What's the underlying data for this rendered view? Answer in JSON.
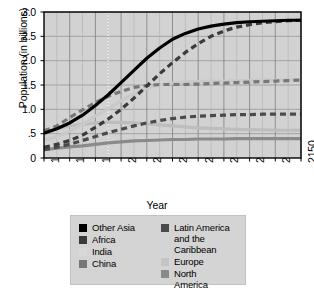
{
  "chart_data": {
    "type": "line",
    "title": "",
    "xlabel": "Year",
    "ylabel": "Population (in billions)",
    "xlim": [
      1950,
      2150
    ],
    "ylim": [
      0,
      3.0
    ],
    "grid": true,
    "legend_position": "below",
    "xticks": [
      "1950",
      "1970",
      "1990",
      "2010",
      "2030",
      "2050",
      "2070",
      "2090",
      "2110",
      "2130",
      "2150"
    ],
    "yticks": [
      "0",
      ".5",
      "1.0",
      "1.5",
      "2.0",
      "2.5",
      "3.0"
    ],
    "ytick_values": [
      0,
      0.5,
      1.0,
      1.5,
      2.0,
      2.5,
      3.0
    ],
    "annotations": [
      {
        "type": "vertical-reference-line",
        "x": 2000,
        "style": "dotted",
        "label": ""
      }
    ],
    "x": [
      1950,
      1960,
      1970,
      1980,
      1990,
      2000,
      2010,
      2020,
      2030,
      2040,
      2050,
      2060,
      2070,
      2080,
      2090,
      2100,
      2110,
      2120,
      2130,
      2140,
      2150
    ],
    "series": [
      {
        "name": "Other Asia",
        "color": "#000000",
        "style": "solid",
        "width": 3.2,
        "values": [
          0.51,
          0.6,
          0.72,
          0.88,
          1.08,
          1.3,
          1.55,
          1.8,
          2.05,
          2.26,
          2.44,
          2.56,
          2.65,
          2.71,
          2.75,
          2.78,
          2.8,
          2.81,
          2.82,
          2.83,
          2.83
        ]
      },
      {
        "name": "Africa",
        "color": "#3a3a3a",
        "style": "dashed",
        "width": 3.2,
        "values": [
          0.22,
          0.28,
          0.36,
          0.47,
          0.63,
          0.8,
          1.0,
          1.23,
          1.48,
          1.73,
          1.96,
          2.17,
          2.35,
          2.5,
          2.61,
          2.69,
          2.74,
          2.78,
          2.8,
          2.82,
          2.83
        ]
      },
      {
        "name": "India",
        "color": "#c9c9c9",
        "style": "solid",
        "width": 3.2,
        "values": [
          0.37,
          0.44,
          0.55,
          0.69,
          0.86,
          1.01,
          1.18,
          1.32,
          1.43,
          1.5,
          1.54,
          1.56,
          1.57,
          1.58,
          1.58,
          1.59,
          1.59,
          1.6,
          1.6,
          1.61,
          1.61
        ]
      },
      {
        "name": "China",
        "color": "#777777",
        "style": "dashed",
        "width": 3.2,
        "values": [
          0.56,
          0.66,
          0.83,
          0.99,
          1.14,
          1.27,
          1.37,
          1.45,
          1.49,
          1.51,
          1.51,
          1.51,
          1.52,
          1.53,
          1.54,
          1.55,
          1.56,
          1.57,
          1.58,
          1.59,
          1.6
        ]
      },
      {
        "name": "Latin America and the Caribbean",
        "color": "#4a4a4a",
        "style": "dashed",
        "width": 3.2,
        "values": [
          0.17,
          0.22,
          0.28,
          0.36,
          0.44,
          0.52,
          0.59,
          0.66,
          0.72,
          0.77,
          0.81,
          0.84,
          0.86,
          0.87,
          0.88,
          0.89,
          0.89,
          0.9,
          0.9,
          0.9,
          0.9
        ]
      },
      {
        "name": "Europe",
        "color": "#bdbdbd",
        "style": "solid",
        "width": 3.2,
        "values": [
          0.55,
          0.6,
          0.66,
          0.69,
          0.72,
          0.73,
          0.73,
          0.72,
          0.7,
          0.68,
          0.66,
          0.64,
          0.62,
          0.61,
          0.6,
          0.59,
          0.58,
          0.58,
          0.57,
          0.57,
          0.57
        ]
      },
      {
        "name": "North America",
        "color": "#8a8a8a",
        "style": "solid",
        "width": 3.2,
        "values": [
          0.17,
          0.2,
          0.23,
          0.25,
          0.28,
          0.31,
          0.33,
          0.35,
          0.36,
          0.37,
          0.38,
          0.38,
          0.39,
          0.39,
          0.39,
          0.4,
          0.4,
          0.4,
          0.4,
          0.4,
          0.4
        ]
      }
    ]
  },
  "axis": {
    "ylabel": "Population (in billions)",
    "xlabel": "Year"
  },
  "legend": {
    "left_column": [
      {
        "label": "Other Asia",
        "label_line2": "",
        "color": "#000000",
        "swatch": "legend-swatch-other-asia"
      },
      {
        "label": "Africa",
        "label_line2": "",
        "color": "#3a3a3a",
        "swatch": "legend-swatch-africa"
      },
      {
        "label": "India",
        "label_line2": "",
        "color": "#d8d8d8",
        "swatch": "legend-swatch-india"
      },
      {
        "label": "China",
        "label_line2": "",
        "color": "#777777",
        "swatch": "legend-swatch-china"
      }
    ],
    "right_column": [
      {
        "label": "Latin America",
        "label_line2": "and the Caribbean",
        "color": "#4a4a4a",
        "swatch": "legend-swatch-latin-america"
      },
      {
        "label": "Europe",
        "label_line2": "",
        "color": "#c4c4c4",
        "swatch": "legend-swatch-europe"
      },
      {
        "label": "North",
        "label_line2": "America",
        "color": "#8a8a8a",
        "swatch": "legend-swatch-north-america"
      }
    ]
  }
}
